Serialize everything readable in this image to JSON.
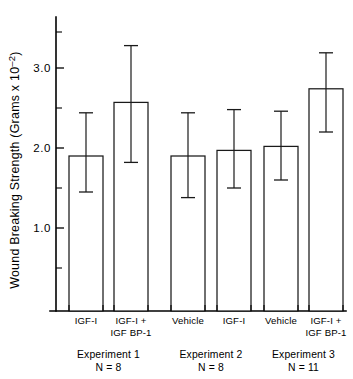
{
  "chart_data": {
    "type": "bar",
    "title": "",
    "xlabel": "",
    "ylabel": "Wound Breaking Strength (Grams x 10",
    "ylabel_exponent": "–2",
    "ylabel_close": ")",
    "ylim": [
      0.0,
      3.45
    ],
    "yticks_major": [
      1.0,
      2.0,
      3.0
    ],
    "ytick_labels": [
      "1.0",
      "2.0",
      "3.0"
    ],
    "yticks_minor": [
      0.5,
      1.5,
      2.5,
      3.45
    ],
    "grid": false,
    "legend": "none",
    "error_bar_type": "symmetric",
    "categories": [
      "IGF-I",
      "IGF-I +\nIGF BP-1",
      "Vehicle",
      "IGF-I",
      "Vehicle",
      "IGF-I +\nIGF BP-1"
    ],
    "bars": [
      {
        "label_line1": "IGF-I",
        "label_line2": "",
        "value": 1.9,
        "err_upper": 2.44,
        "err_lower": 1.45,
        "group": 0
      },
      {
        "label_line1": "IGF-I +",
        "label_line2": "IGF BP-1",
        "value": 2.57,
        "err_upper": 3.28,
        "err_lower": 1.82,
        "group": 0
      },
      {
        "label_line1": "Vehicle",
        "label_line2": "",
        "value": 1.9,
        "err_upper": 2.44,
        "err_lower": 1.38,
        "group": 1
      },
      {
        "label_line1": "IGF-I",
        "label_line2": "",
        "value": 1.97,
        "err_upper": 2.48,
        "err_lower": 1.5,
        "group": 1
      },
      {
        "label_line1": "Vehicle",
        "label_line2": "",
        "value": 2.02,
        "err_upper": 2.46,
        "err_lower": 1.6,
        "group": 2
      },
      {
        "label_line1": "IGF-I +",
        "label_line2": "IGF BP-1",
        "value": 2.74,
        "err_upper": 3.19,
        "err_lower": 2.2,
        "group": 2
      }
    ],
    "values": [
      1.9,
      2.57,
      1.9,
      1.97,
      2.02,
      2.74
    ],
    "err_upper": [
      2.44,
      3.28,
      2.44,
      2.48,
      2.46,
      3.19
    ],
    "err_lower": [
      1.45,
      1.82,
      1.38,
      1.5,
      1.6,
      2.2
    ],
    "groups": [
      {
        "name": "Experiment 1",
        "n": "N = 8",
        "bars": [
          0,
          1
        ]
      },
      {
        "name": "Experiment 2",
        "n": "N = 8",
        "bars": [
          2,
          3
        ]
      },
      {
        "name": "Experiment 3",
        "n": "N = 11",
        "bars": [
          4,
          5
        ]
      }
    ]
  },
  "colors": {
    "bar_fill": "#ffffff",
    "bar_stroke": "#1a1a1a",
    "axis": "#000000",
    "background": "#ffffff",
    "text": "#000000"
  }
}
